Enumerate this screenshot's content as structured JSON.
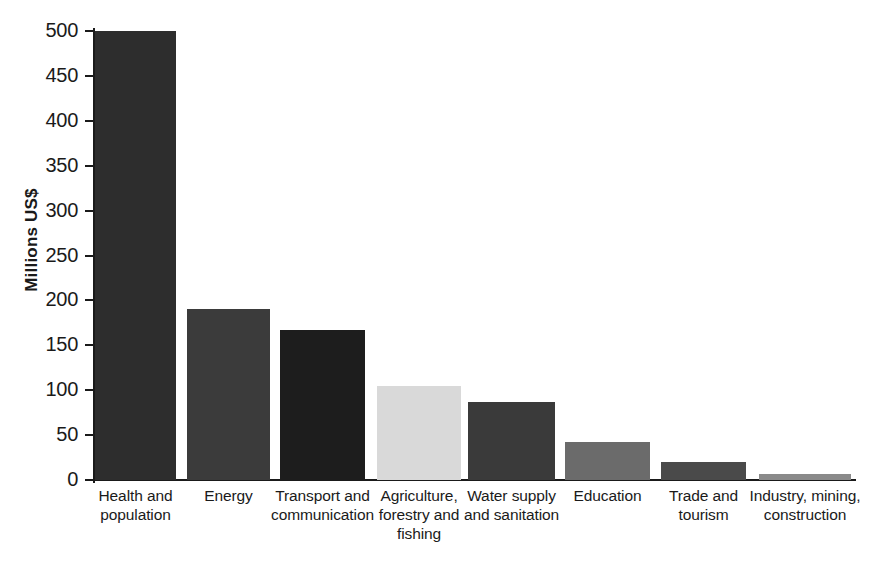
{
  "chart_data": {
    "type": "bar",
    "title": "",
    "xlabel": "",
    "ylabel": "Millions US$",
    "ylim": [
      0,
      500
    ],
    "ytick_step": 50,
    "yticks": [
      "500",
      "450",
      "400",
      "350",
      "300",
      "250",
      "200",
      "150",
      "100",
      "50",
      "0"
    ],
    "grid": false,
    "legend": "none",
    "categories": [
      "Health and population",
      "Energy",
      "Transport and communication",
      "Agriculture, forestry and fishing",
      "Water supply and sanitation",
      "Education",
      "Trade and tourism",
      "Industry, mining, construction"
    ],
    "category_lines": [
      [
        "Health and",
        "population"
      ],
      [
        "Energy"
      ],
      [
        "Transport and",
        "communication"
      ],
      [
        "Agriculture,",
        "forestry and",
        "fishing"
      ],
      [
        "Water supply",
        "and sanitation"
      ],
      [
        "Education"
      ],
      [
        "Trade and",
        "tourism"
      ],
      [
        "Industry, mining,",
        "construction"
      ]
    ],
    "values": [
      500,
      190,
      167,
      105,
      87,
      42,
      20,
      7
    ],
    "bar_colors": [
      "#2d2d2d",
      "#3b3b3b",
      "#1d1d1d",
      "#d9d9d9",
      "#3a3a3a",
      "#6b6b6b",
      "#4a4a4a",
      "#8a8a8a"
    ]
  },
  "axis": {
    "y_title": "Millions US$"
  }
}
